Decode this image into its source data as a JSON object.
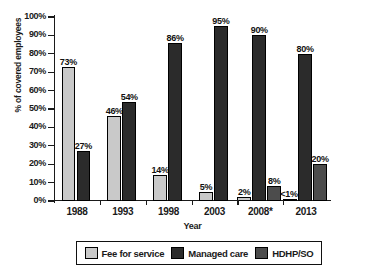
{
  "chart_data": {
    "type": "bar",
    "title": "",
    "subtitle": "",
    "xlabel": "Year",
    "ylabel": "% of covered employees",
    "categories": [
      "1988",
      "1993",
      "1998",
      "2003",
      "2008*",
      "2013"
    ],
    "ylim": [
      0,
      100
    ],
    "ytick_labels": [
      "0%",
      "10%",
      "20%",
      "30%",
      "40%",
      "50%",
      "60%",
      "70%",
      "80%",
      "90%",
      "100%"
    ],
    "ytick_values": [
      0,
      10,
      20,
      30,
      40,
      50,
      60,
      70,
      80,
      90,
      100
    ],
    "grid": false,
    "legend_position": "bottom",
    "series": [
      {
        "name": "Fee for service",
        "color": "#c9c9c9",
        "values": [
          73,
          46,
          14,
          5,
          2,
          0.5
        ],
        "labels": [
          "73%",
          "46%",
          "14%",
          "5%",
          "2%",
          "<1%"
        ]
      },
      {
        "name": "Managed care",
        "color": "#2b2b2b",
        "values": [
          27,
          54,
          86,
          95,
          90,
          80
        ],
        "labels": [
          "27%",
          "54%",
          "86%",
          "95%",
          "90%",
          "80%"
        ]
      },
      {
        "name": "HDHP/SO",
        "color": "#4c4c4c",
        "values": [
          null,
          null,
          null,
          null,
          8,
          20
        ],
        "labels": [
          null,
          null,
          null,
          null,
          "8%",
          "20%"
        ]
      }
    ]
  },
  "legend": {
    "items": [
      {
        "label": "Fee for service",
        "color": "#c9c9c9"
      },
      {
        "label": "Managed care",
        "color": "#2b2b2b"
      },
      {
        "label": "HDHP/SO",
        "color": "#4c4c4c"
      }
    ]
  }
}
